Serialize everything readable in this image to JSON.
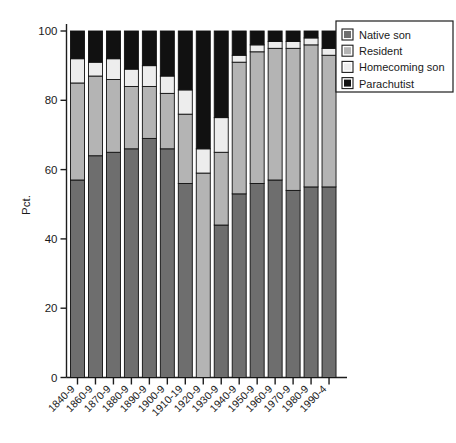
{
  "chart_data": {
    "type": "bar",
    "subtype": "stacked-bar-100-percent",
    "title": "",
    "xlabel": "",
    "ylabel": "Pct.",
    "ylim": [
      0,
      100
    ],
    "yticks": [
      0,
      20,
      40,
      60,
      80,
      100
    ],
    "grid": false,
    "legend_position": "top-right",
    "categories": [
      "1840-9",
      "1860-9",
      "1870-9",
      "1880-9",
      "1890-9",
      "1900-9",
      "1910-19",
      "1920-9",
      "1930-9",
      "1940-9",
      "1950-9",
      "1960-9",
      "1970-9",
      "1980-9",
      "1990-4"
    ],
    "series": [
      {
        "name": "Native son",
        "color": "#6e6e6e",
        "values": [
          57,
          64,
          65,
          66,
          69,
          66,
          56,
          0,
          44,
          53,
          56,
          57,
          54,
          55,
          55
        ]
      },
      {
        "name": "Resident",
        "color": "#b4b4b4",
        "values": [
          28,
          23,
          21,
          18,
          15,
          16,
          20,
          59,
          21,
          38,
          38,
          38,
          41,
          41,
          38
        ]
      },
      {
        "name": "Homecoming son",
        "color": "#ededed",
        "values": [
          7,
          4,
          6,
          5,
          6,
          5,
          7,
          7,
          10,
          2,
          2,
          2,
          2,
          2,
          2
        ]
      },
      {
        "name": "Parachutist",
        "color": "#111111",
        "values": [
          8,
          9,
          8,
          11,
          10,
          13,
          17,
          34,
          25,
          7,
          4,
          3,
          3,
          2,
          5
        ]
      }
    ]
  },
  "legend": {
    "items": [
      {
        "label": "Native son",
        "color": "#6e6e6e"
      },
      {
        "label": "Resident",
        "color": "#b4b4b4"
      },
      {
        "label": "Homecoming son",
        "color": "#ededed"
      },
      {
        "label": "Parachutist",
        "color": "#111111"
      }
    ]
  },
  "axis": {
    "y_label": "Pct.",
    "y_tick_labels": [
      "0",
      "20",
      "40",
      "60",
      "80",
      "100"
    ],
    "y_tick_values": [
      0,
      20,
      40,
      60,
      80,
      100
    ]
  }
}
